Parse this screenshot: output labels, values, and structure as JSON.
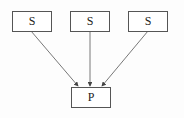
{
  "diagram": {
    "sources": [
      {
        "label": "S"
      },
      {
        "label": "S"
      },
      {
        "label": "S"
      }
    ],
    "target": {
      "label": "P"
    },
    "edges": [
      {
        "from": 0,
        "to": "target"
      },
      {
        "from": 1,
        "to": "target"
      },
      {
        "from": 2,
        "to": "target"
      }
    ],
    "colors": {
      "line": "#555555",
      "text": "#222222",
      "background": "#fdfdfd"
    }
  }
}
